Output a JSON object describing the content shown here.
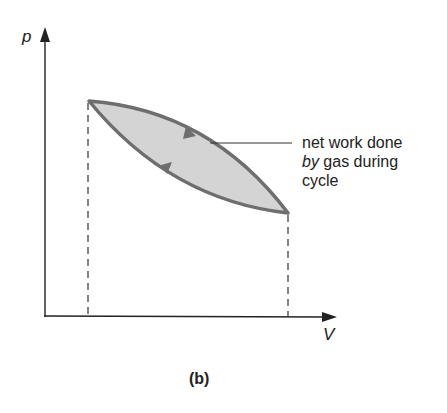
{
  "diagram": {
    "caption": "(b)",
    "axes": {
      "y_label": "p",
      "x_label": "V"
    },
    "annotation": {
      "line1": "net work done",
      "line2_italic": "by",
      "line2_rest": " gas during",
      "line3": "cycle"
    },
    "colors": {
      "curve": "#6e6e6e",
      "fill": "#d4d4d4",
      "axis": "#222222"
    },
    "points": {
      "left": [
        89,
        101
      ],
      "right": [
        288,
        213
      ]
    }
  }
}
